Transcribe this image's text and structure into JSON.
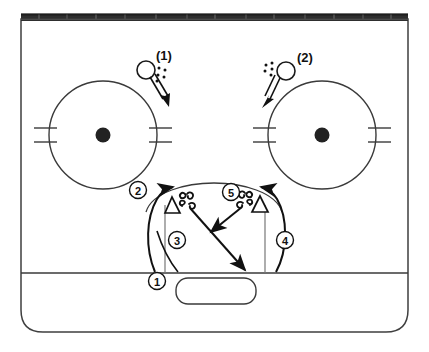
{
  "diagram": {
    "type": "ice-hockey-drill",
    "surface": {
      "name": "offensive-zone",
      "boards_color": "#2b2b2b",
      "line_color": "#333333",
      "fill_color": "#ffffff"
    }
  },
  "labels": {
    "shooter_left": "(1)",
    "shooter_right": "(2)",
    "step_1": "1",
    "step_2": "2",
    "step_3": "3",
    "step_4": "4",
    "step_5": "5"
  },
  "markers": {
    "faceoff_left": {
      "cx": 103,
      "cy": 135,
      "r": 54
    },
    "faceoff_right": {
      "cx": 322,
      "cy": 135,
      "r": 54
    },
    "player_left": {
      "cx": 146,
      "cy": 70,
      "r": 9
    },
    "player_right": {
      "cx": 286,
      "cy": 71,
      "r": 9
    },
    "cone_left": {
      "cx": 172,
      "cy": 205
    },
    "cone_right": {
      "cx": 260,
      "cy": 203
    }
  },
  "legend": {
    "circle_meaning": "player-with-puck",
    "triangle_meaning": "cone",
    "double_arrow_meaning": "shot",
    "squiggle_meaning": "pivot-turn",
    "solid_arrow_meaning": "pass"
  },
  "colors": {
    "ink": "#1a1a1a",
    "rink_line": "#3a3a3a",
    "boards": "#2e2e2e"
  }
}
